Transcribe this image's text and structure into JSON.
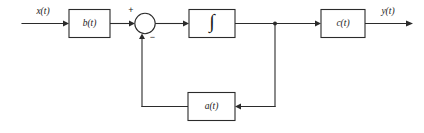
{
  "diagram": {
    "kind": "control-system-block-diagram",
    "background_color": "#ffffff",
    "line_color": "#2b2b2b",
    "signals": {
      "input_label": "x(t)",
      "output_label": "y(t)"
    },
    "blocks": [
      {
        "id": "b",
        "label": "b(t)",
        "name": "input-gain-block"
      },
      {
        "id": "int",
        "label": "∫",
        "name": "integrator-block"
      },
      {
        "id": "c",
        "label": "c(t)",
        "name": "output-gain-block"
      },
      {
        "id": "a",
        "label": "a(t)",
        "name": "feedback-gain-block"
      }
    ],
    "summing_junction": {
      "name": "summing-junction",
      "plus_sign": "+",
      "minus_sign": "−"
    },
    "nodes": {
      "branch_point_label": ""
    }
  }
}
